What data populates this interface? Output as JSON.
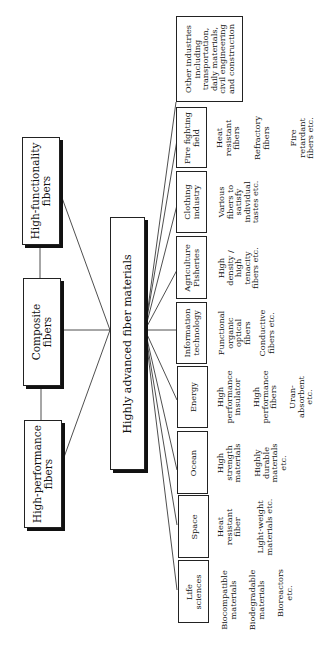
{
  "diagram": {
    "center": {
      "label": "Highly advanced fiber materials"
    },
    "fiber_types": [
      {
        "label_line1": "High-functionality",
        "label_line2": "fibers"
      },
      {
        "label_line1": "Composite",
        "label_line2": "fibers"
      },
      {
        "label_line1": "High-performance",
        "label_line2": "fibers"
      }
    ],
    "fields": [
      {
        "lines": [
          "Other industries",
          "including",
          "transportation,",
          "daily materials,",
          "civil engineering",
          "and construction"
        ],
        "examples": []
      },
      {
        "lines": [
          "Fire fighting",
          "field"
        ],
        "examples": [
          [
            "Heat",
            "resistant",
            "fibers"
          ],
          [
            "Refractory",
            "fibers"
          ],
          [
            "Fire",
            "retardant",
            "fibers etc."
          ]
        ]
      },
      {
        "lines": [
          "Clothing",
          "industry"
        ],
        "examples": [
          [
            "Various",
            "fibers to",
            "satisfy",
            "individual",
            "tastes etc."
          ]
        ]
      },
      {
        "lines": [
          "Agriculture",
          "Fisheries"
        ],
        "examples": [
          [
            "High",
            "density /",
            "high",
            "tenacity",
            "fibers etc."
          ]
        ]
      },
      {
        "lines": [
          "Information",
          "technology"
        ],
        "examples": [
          [
            "Functional",
            "organic",
            "optical",
            "fibers"
          ],
          [
            "Conductive",
            "fibers etc."
          ]
        ]
      },
      {
        "lines": [
          "Energy"
        ],
        "examples": [
          [
            "High",
            "performance",
            "insulator"
          ],
          [
            "High",
            "performance",
            "fibers"
          ],
          [
            "Uran-",
            "absorbent",
            "etc."
          ]
        ]
      },
      {
        "lines": [
          "Ocean"
        ],
        "examples": [
          [
            "High",
            "strength",
            "materials"
          ],
          [
            "Highly",
            "durable",
            "materials",
            "etc."
          ]
        ]
      },
      {
        "lines": [
          "Space"
        ],
        "examples": [
          [
            "Heat",
            "resistant",
            "fiber"
          ],
          [
            "Light-weight",
            "materials etc."
          ]
        ]
      },
      {
        "lines": [
          "Life",
          "sciences"
        ],
        "examples": [
          [
            "Biocompatible",
            "materials"
          ],
          [
            "Biodegradable",
            "materials"
          ],
          [
            "Bioreactors",
            "etc."
          ]
        ]
      }
    ]
  }
}
